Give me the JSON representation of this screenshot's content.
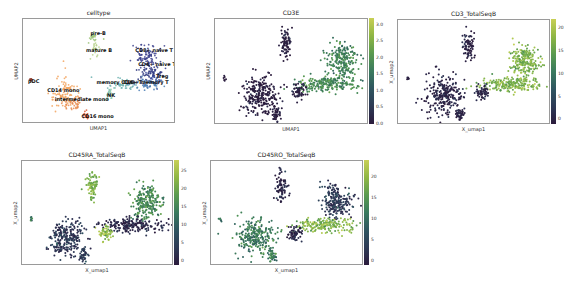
{
  "panels": [
    {
      "id": "celltype",
      "title": "celltype",
      "xlabel": "UMAP1",
      "ylabel": "UMAP2",
      "frame": {
        "x": 22,
        "y": 18,
        "w": 153,
        "h": 105
      },
      "colorbar": null
    },
    {
      "id": "cd3e",
      "title": "CD3E",
      "xlabel": "UMAP1",
      "ylabel": "UMAP2",
      "frame": {
        "x": 214,
        "y": 18,
        "w": 154,
        "h": 106
      },
      "colorbar": {
        "ticks": [
          "3.0",
          "2.5",
          "2.0",
          "1.5",
          "1.0",
          "0.5",
          "0.0"
        ],
        "min": 0,
        "max": 3.2
      }
    },
    {
      "id": "cd3_totalseqb",
      "title": "CD3_TotalSeqB",
      "xlabel": "X_umap1",
      "ylabel": "X_umap2",
      "frame": {
        "x": 397,
        "y": 19,
        "w": 153,
        "h": 105
      },
      "colorbar": {
        "ticks": [
          "20",
          "15",
          "10",
          "5",
          "0"
        ],
        "min": -1,
        "max": 22
      }
    },
    {
      "id": "cd45ra_totalseqb",
      "title": "CD45RA_TotalSeqB",
      "xlabel": "X_umap1",
      "ylabel": "X_umap2",
      "frame": {
        "x": 21,
        "y": 160,
        "w": 152,
        "h": 105
      },
      "colorbar": {
        "ticks": [
          "25",
          "20",
          "15",
          "10",
          "5",
          "0"
        ],
        "min": -1,
        "max": 28
      }
    },
    {
      "id": "cd45ro_totalseqb",
      "title": "CD45RO_TotalSeqB",
      "xlabel": "X_umap1",
      "ylabel": "X_umap2",
      "frame": {
        "x": 210,
        "y": 160,
        "w": 153,
        "h": 105
      },
      "colorbar": {
        "ticks": [
          "20",
          "15",
          "10",
          "5",
          "0"
        ],
        "min": -1,
        "max": 24
      }
    }
  ],
  "chart_data": [
    {
      "type": "scatter",
      "title": "celltype",
      "xlabel": "UMAP1",
      "ylabel": "UMAP2",
      "legend_position": "on data",
      "clusters": [
        {
          "name": "pre-B",
          "color": "#9dc47a",
          "cx": 0.46,
          "cy": 0.16,
          "rx": 0.035,
          "ry": 0.06
        },
        {
          "name": "mature B",
          "color": "#b5d08a",
          "cx": 0.47,
          "cy": 0.27,
          "rx": 0.03,
          "ry": 0.07
        },
        {
          "name": "CD8+ naive T",
          "color": "#3b3f8c",
          "cx": 0.82,
          "cy": 0.36,
          "rx": 0.1,
          "ry": 0.16
        },
        {
          "name": "CD4+ naive T",
          "color": "#2f3a80",
          "cx": 0.84,
          "cy": 0.52,
          "rx": 0.08,
          "ry": 0.1
        },
        {
          "name": "Treg",
          "color": "#3d4fa0",
          "cx": 0.88,
          "cy": 0.6,
          "rx": 0.05,
          "ry": 0.05
        },
        {
          "name": "memory CD4+ T",
          "color": "#6fb2b0",
          "cx": 0.66,
          "cy": 0.63,
          "rx": 0.1,
          "ry": 0.06
        },
        {
          "name": "CD8+ memory T",
          "color": "#4c7fb5",
          "cx": 0.82,
          "cy": 0.63,
          "rx": 0.12,
          "ry": 0.06
        },
        {
          "name": "NK",
          "color": "#8cc9b0",
          "cx": 0.57,
          "cy": 0.72,
          "rx": 0.04,
          "ry": 0.06
        },
        {
          "name": "pDC",
          "color": "#8a3a2a",
          "cx": 0.04,
          "cy": 0.58,
          "rx": 0.008,
          "ry": 0.015
        },
        {
          "name": "CD14 mono",
          "color": "#f2a35e",
          "cx": 0.27,
          "cy": 0.72,
          "rx": 0.1,
          "ry": 0.16
        },
        {
          "name": "intermediate mono",
          "color": "#e88a4e",
          "cx": 0.32,
          "cy": 0.82,
          "rx": 0.06,
          "ry": 0.08
        },
        {
          "name": "CD16 mono",
          "color": "#d9542a",
          "cx": 0.41,
          "cy": 0.95,
          "rx": 0.025,
          "ry": 0.05
        }
      ],
      "labels": [
        {
          "text": "pre-B",
          "x": 0.44,
          "y": 0.13
        },
        {
          "text": "mature B",
          "x": 0.41,
          "y": 0.3
        },
        {
          "text": "CD8+ naive T",
          "x": 0.74,
          "y": 0.3
        },
        {
          "text": "CD4+ naive T",
          "x": 0.76,
          "y": 0.44
        },
        {
          "text": "Treg",
          "x": 0.88,
          "y": 0.57
        },
        {
          "text": "memory CD4+ T",
          "x": 0.48,
          "y": 0.63
        },
        {
          "text": "CD8+ memory T",
          "x": 0.66,
          "y": 0.63
        },
        {
          "text": "NK",
          "x": 0.55,
          "y": 0.76
        },
        {
          "text": "pDC",
          "x": 0.02,
          "y": 0.62
        },
        {
          "text": "CD14 mono",
          "x": 0.15,
          "y": 0.71
        },
        {
          "text": "intermediate mono",
          "x": 0.2,
          "y": 0.8
        },
        {
          "text": "CD16 mono",
          "x": 0.38,
          "y": 0.97
        }
      ]
    },
    {
      "type": "scatter",
      "title": "CD3E",
      "xlabel": "UMAP1",
      "ylabel": "UMAP2",
      "colorbar_range": [
        0,
        3.2
      ],
      "cluster_values": {
        "B": 0.05,
        "T_upper": 1.8,
        "T_lower": 1.9,
        "NK": 0.1,
        "mono": 0.05,
        "pDC": 0.05
      }
    },
    {
      "type": "scatter",
      "title": "CD3_TotalSeqB",
      "xlabel": "X_umap1",
      "ylabel": "X_umap2",
      "colorbar_range": [
        -1,
        22
      ],
      "cluster_values": {
        "B": 0.5,
        "T_upper": 17,
        "T_lower": 17,
        "NK": 1,
        "mono": 1,
        "pDC": 0.5
      }
    },
    {
      "type": "scatter",
      "title": "CD45RA_TotalSeqB",
      "xlabel": "X_umap1",
      "ylabel": "X_umap2",
      "colorbar_range": [
        -1,
        28
      ],
      "cluster_values": {
        "B": 22,
        "T_upper": 16,
        "T_lower": 2,
        "NK": 24,
        "mono": 5,
        "pDC": 14
      }
    },
    {
      "type": "scatter",
      "title": "CD45RO_TotalSeqB",
      "xlabel": "X_umap1",
      "ylabel": "X_umap2",
      "colorbar_range": [
        -1,
        24
      ],
      "cluster_values": {
        "B": 1,
        "T_upper": 4,
        "T_lower": 19,
        "NK": 1.5,
        "mono": 12,
        "pDC": 11
      }
    }
  ],
  "blobs": [
    {
      "key": "B",
      "cx": 0.46,
      "cy": 0.23,
      "rx": 0.04,
      "ry": 0.14,
      "n": 80
    },
    {
      "key": "T_upper",
      "cx": 0.83,
      "cy": 0.38,
      "rx": 0.1,
      "ry": 0.17,
      "n": 220
    },
    {
      "key": "T_lower",
      "cx": 0.74,
      "cy": 0.62,
      "rx": 0.2,
      "ry": 0.07,
      "n": 200
    },
    {
      "key": "NK",
      "cx": 0.55,
      "cy": 0.7,
      "rx": 0.045,
      "ry": 0.08,
      "n": 60
    },
    {
      "key": "mono",
      "cx": 0.29,
      "cy": 0.74,
      "rx": 0.12,
      "ry": 0.18,
      "n": 260
    },
    {
      "key": "mono_tail",
      "cx": 0.4,
      "cy": 0.92,
      "rx": 0.03,
      "ry": 0.07,
      "n": 40
    },
    {
      "key": "pDC",
      "cx": 0.05,
      "cy": 0.56,
      "rx": 0.008,
      "ry": 0.02,
      "n": 6
    }
  ]
}
